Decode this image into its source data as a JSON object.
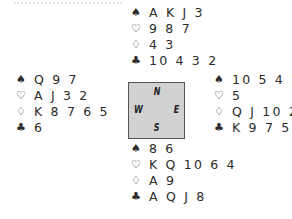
{
  "symbols": {
    "spades": "♠",
    "hearts": "♡",
    "diamonds": "♢",
    "clubs": "♣"
  },
  "compass": {
    "north": "N",
    "south": "S",
    "west": "W",
    "east": "E"
  },
  "hands": {
    "north": {
      "spades": "A K J 3",
      "hearts": "9 8 7",
      "diamonds": "4 3",
      "clubs": "10 4 3 2"
    },
    "west": {
      "spades": "Q 9 7",
      "hearts": "A J 3 2",
      "diamonds": "K 8 7 6 5",
      "clubs": "6"
    },
    "east": {
      "spades": "10 5 4 2",
      "hearts": "5",
      "diamonds": "Q J 10 2",
      "clubs": "K 9 7 5"
    },
    "south": {
      "spades": "8 6",
      "hearts": "K Q 10 6 4",
      "diamonds": "A 9",
      "clubs": "A Q J 8"
    }
  }
}
